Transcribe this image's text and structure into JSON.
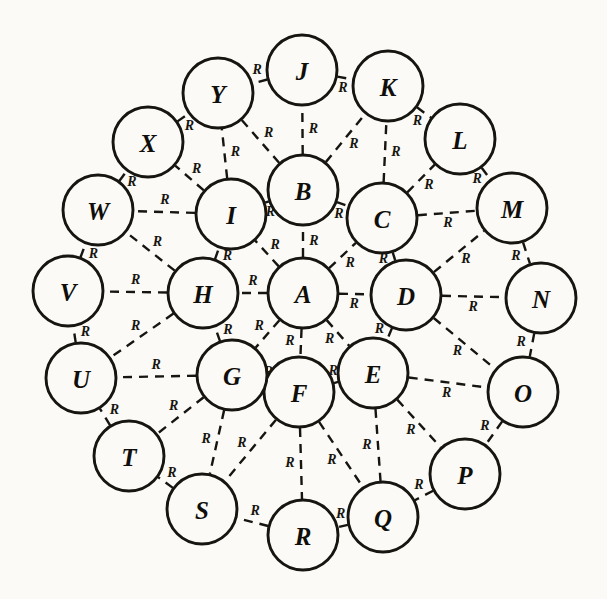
{
  "diagram": {
    "type": "node-link-graph",
    "background_color": "#fbfaf7",
    "ink_color": "#17150f",
    "node_fill_color": "#fbfaf7",
    "edge_style": "dashed",
    "edge_label_text": "R",
    "node_radius": 35,
    "nodes": [
      {
        "id": "A",
        "label": "A",
        "cx": 303,
        "cy": 293,
        "ring": "center"
      },
      {
        "id": "B",
        "label": "B",
        "cx": 303,
        "cy": 190,
        "ring": "inner"
      },
      {
        "id": "C",
        "label": "C",
        "cx": 382,
        "cy": 218,
        "ring": "inner"
      },
      {
        "id": "D",
        "label": "D",
        "cx": 406,
        "cy": 295,
        "ring": "inner"
      },
      {
        "id": "E",
        "label": "E",
        "cx": 373,
        "cy": 373,
        "ring": "inner"
      },
      {
        "id": "F",
        "label": "F",
        "cx": 299,
        "cy": 392,
        "ring": "inner"
      },
      {
        "id": "G",
        "label": "G",
        "cx": 232,
        "cy": 375,
        "ring": "inner"
      },
      {
        "id": "H",
        "label": "H",
        "cx": 203,
        "cy": 293,
        "ring": "inner"
      },
      {
        "id": "I",
        "label": "I",
        "cx": 231,
        "cy": 214,
        "ring": "inner"
      },
      {
        "id": "J",
        "label": "J",
        "cx": 302,
        "cy": 70,
        "ring": "outer"
      },
      {
        "id": "K",
        "label": "K",
        "cx": 388,
        "cy": 86,
        "ring": "outer"
      },
      {
        "id": "L",
        "label": "L",
        "cx": 460,
        "cy": 139,
        "ring": "outer"
      },
      {
        "id": "M",
        "label": "M",
        "cx": 512,
        "cy": 208,
        "ring": "outer"
      },
      {
        "id": "N",
        "label": "N",
        "cx": 541,
        "cy": 298,
        "ring": "outer"
      },
      {
        "id": "O",
        "label": "O",
        "cx": 523,
        "cy": 392,
        "ring": "outer"
      },
      {
        "id": "P",
        "label": "P",
        "cx": 465,
        "cy": 474,
        "ring": "outer"
      },
      {
        "id": "Q",
        "label": "Q",
        "cx": 383,
        "cy": 517,
        "ring": "outer"
      },
      {
        "id": "R",
        "label": "R",
        "cx": 303,
        "cy": 535,
        "ring": "outer"
      },
      {
        "id": "S",
        "label": "S",
        "cx": 202,
        "cy": 509,
        "ring": "outer"
      },
      {
        "id": "T",
        "label": "T",
        "cx": 129,
        "cy": 456,
        "ring": "outer"
      },
      {
        "id": "U",
        "label": "U",
        "cx": 81,
        "cy": 378,
        "ring": "outer"
      },
      {
        "id": "V",
        "label": "V",
        "cx": 68,
        "cy": 291,
        "ring": "outer"
      },
      {
        "id": "W",
        "label": "W",
        "cx": 98,
        "cy": 210,
        "ring": "outer"
      },
      {
        "id": "X",
        "label": "X",
        "cx": 148,
        "cy": 142,
        "ring": "outer"
      },
      {
        "id": "Y",
        "label": "Y",
        "cx": 218,
        "cy": 93,
        "ring": "outer"
      }
    ],
    "edges": [
      {
        "from": "A",
        "to": "B",
        "label": "R"
      },
      {
        "from": "A",
        "to": "C",
        "label": "R"
      },
      {
        "from": "A",
        "to": "D",
        "label": "R"
      },
      {
        "from": "A",
        "to": "E",
        "label": "R"
      },
      {
        "from": "A",
        "to": "F",
        "label": "R"
      },
      {
        "from": "A",
        "to": "G",
        "label": "R"
      },
      {
        "from": "A",
        "to": "H",
        "label": "R"
      },
      {
        "from": "A",
        "to": "I",
        "label": "R"
      },
      {
        "from": "B",
        "to": "C",
        "label": "R"
      },
      {
        "from": "C",
        "to": "D",
        "label": "R"
      },
      {
        "from": "D",
        "to": "E",
        "label": "R"
      },
      {
        "from": "E",
        "to": "F",
        "label": "R"
      },
      {
        "from": "F",
        "to": "G",
        "label": "R"
      },
      {
        "from": "G",
        "to": "H",
        "label": "R"
      },
      {
        "from": "H",
        "to": "I",
        "label": "R"
      },
      {
        "from": "I",
        "to": "B",
        "label": "R"
      },
      {
        "from": "B",
        "to": "J",
        "label": "R"
      },
      {
        "from": "B",
        "to": "Y",
        "label": "R"
      },
      {
        "from": "B",
        "to": "K",
        "label": "R"
      },
      {
        "from": "C",
        "to": "K",
        "label": "R"
      },
      {
        "from": "C",
        "to": "L",
        "label": "R"
      },
      {
        "from": "C",
        "to": "M",
        "label": "R"
      },
      {
        "from": "D",
        "to": "M",
        "label": "R"
      },
      {
        "from": "D",
        "to": "N",
        "label": "R"
      },
      {
        "from": "D",
        "to": "O",
        "label": "R"
      },
      {
        "from": "E",
        "to": "O",
        "label": "R"
      },
      {
        "from": "E",
        "to": "P",
        "label": "R"
      },
      {
        "from": "E",
        "to": "Q",
        "label": "R"
      },
      {
        "from": "F",
        "to": "Q",
        "label": "R"
      },
      {
        "from": "F",
        "to": "R",
        "label": "R"
      },
      {
        "from": "F",
        "to": "S",
        "label": "R"
      },
      {
        "from": "G",
        "to": "S",
        "label": "R"
      },
      {
        "from": "G",
        "to": "T",
        "label": "R"
      },
      {
        "from": "G",
        "to": "U",
        "label": "R"
      },
      {
        "from": "H",
        "to": "U",
        "label": "R"
      },
      {
        "from": "H",
        "to": "V",
        "label": "R"
      },
      {
        "from": "H",
        "to": "W",
        "label": "R"
      },
      {
        "from": "I",
        "to": "W",
        "label": "R"
      },
      {
        "from": "I",
        "to": "X",
        "label": "R"
      },
      {
        "from": "I",
        "to": "Y",
        "label": "R"
      },
      {
        "from": "J",
        "to": "Y",
        "label": "R"
      },
      {
        "from": "J",
        "to": "K",
        "label": "R"
      },
      {
        "from": "K",
        "to": "L",
        "label": "R"
      },
      {
        "from": "L",
        "to": "M",
        "label": "R"
      },
      {
        "from": "M",
        "to": "N",
        "label": "R"
      },
      {
        "from": "N",
        "to": "O",
        "label": "R"
      },
      {
        "from": "O",
        "to": "P",
        "label": "R"
      },
      {
        "from": "P",
        "to": "Q",
        "label": "R"
      },
      {
        "from": "Q",
        "to": "R",
        "label": "R"
      },
      {
        "from": "R",
        "to": "S",
        "label": "R"
      },
      {
        "from": "S",
        "to": "T",
        "label": "R"
      },
      {
        "from": "T",
        "to": "U",
        "label": "R"
      },
      {
        "from": "U",
        "to": "V",
        "label": "R"
      },
      {
        "from": "V",
        "to": "W",
        "label": "R"
      },
      {
        "from": "W",
        "to": "X",
        "label": "R"
      },
      {
        "from": "X",
        "to": "Y",
        "label": "R"
      }
    ]
  }
}
